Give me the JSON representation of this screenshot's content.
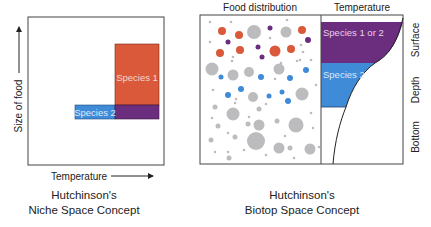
{
  "niche_panel": {
    "y_axis_label": "Size of food",
    "x_axis_label": "Temperature",
    "species1_label": "Species 1",
    "species2_label": "Species 2",
    "caption_line1": "Hutchinson's",
    "caption_line2": "Niche Space Concept"
  },
  "biotop_panel": {
    "food_header": "Food distribution",
    "temperature_header": "Temperature",
    "band_top_label": "Species 1 or 2",
    "band_mid_label": "Species 2",
    "depth_labels": [
      "Surface",
      "Depth",
      "Bottom"
    ],
    "caption_line1": "Hutchinson's",
    "caption_line2": "Biotop Space Concept"
  },
  "colors": {
    "species1": "#d9593a",
    "species2": "#3f8bd8",
    "overlap": "#6b2d7e",
    "food_gray": "#bcbcbf"
  },
  "food_dots": {
    "orange": [
      [
        222,
        31,
        4
      ],
      [
        239,
        35,
        4
      ],
      [
        302,
        30,
        4
      ],
      [
        220,
        53,
        4
      ],
      [
        240,
        50,
        4
      ],
      [
        275,
        51,
        5.5
      ],
      [
        291,
        49,
        4
      ]
    ],
    "purple": [
      [
        228,
        42,
        2.5
      ],
      [
        258,
        47,
        2.5
      ],
      [
        270,
        28,
        2.5
      ],
      [
        308,
        40,
        3
      ],
      [
        262,
        57,
        2.5
      ]
    ],
    "blue": [
      [
        221,
        77,
        2.5
      ],
      [
        261,
        77,
        3
      ],
      [
        290,
        78,
        3
      ],
      [
        306,
        70,
        3
      ],
      [
        228,
        95,
        3
      ],
      [
        241,
        89,
        3
      ],
      [
        269,
        96,
        2.5
      ],
      [
        282,
        92,
        2.5
      ],
      [
        288,
        101,
        3
      ]
    ],
    "gray_large": [
      [
        254,
        32,
        7
      ],
      [
        286,
        32,
        5.5
      ],
      [
        212,
        69,
        6.5
      ],
      [
        233,
        75,
        5.5
      ],
      [
        249,
        72,
        5
      ],
      [
        279,
        69,
        5.5
      ],
      [
        253,
        97,
        5
      ],
      [
        302,
        94,
        6.5
      ],
      [
        233,
        114,
        6.5
      ],
      [
        259,
        125,
        5.5
      ],
      [
        296,
        125,
        7.5
      ],
      [
        256,
        141,
        9
      ],
      [
        279,
        148,
        5.5
      ],
      [
        310,
        149,
        5.5
      ]
    ],
    "gray_small": [
      [
        210,
        22,
        1.3
      ],
      [
        231,
        22,
        1.3
      ],
      [
        287,
        20,
        1.3
      ],
      [
        210,
        42,
        1.3
      ],
      [
        270,
        38,
        1.3
      ],
      [
        233,
        57,
        1.3
      ],
      [
        301,
        45,
        1.3
      ],
      [
        303,
        52,
        1.3
      ],
      [
        300,
        60,
        1.3
      ],
      [
        281,
        63,
        1.3
      ],
      [
        232,
        61,
        1.3
      ],
      [
        297,
        61,
        1.3
      ],
      [
        311,
        60,
        1.3
      ],
      [
        213,
        90,
        1.3
      ],
      [
        236,
        99,
        1.3
      ],
      [
        275,
        79,
        1.3
      ],
      [
        316,
        85,
        1.3
      ],
      [
        215,
        107,
        2.5
      ],
      [
        218,
        126,
        2.5
      ],
      [
        235,
        137,
        2.5
      ],
      [
        248,
        124,
        2.5
      ],
      [
        259,
        109,
        2.5
      ],
      [
        277,
        121,
        2.5
      ],
      [
        290,
        148,
        2.5
      ],
      [
        211,
        140,
        2.5
      ],
      [
        229,
        158,
        2.5
      ],
      [
        212,
        118,
        1.3
      ],
      [
        228,
        133,
        1.3
      ],
      [
        249,
        117,
        1.3
      ],
      [
        228,
        152,
        1.3
      ],
      [
        215,
        152,
        1.3
      ],
      [
        244,
        150,
        1.3
      ],
      [
        266,
        155,
        1.3
      ],
      [
        294,
        158,
        1.3
      ],
      [
        311,
        113,
        1.3
      ],
      [
        313,
        128,
        1.3
      ],
      [
        285,
        136,
        1.3
      ],
      [
        266,
        104,
        1.3
      ],
      [
        235,
        103,
        1.3
      ],
      [
        319,
        147,
        1.3
      ]
    ]
  }
}
